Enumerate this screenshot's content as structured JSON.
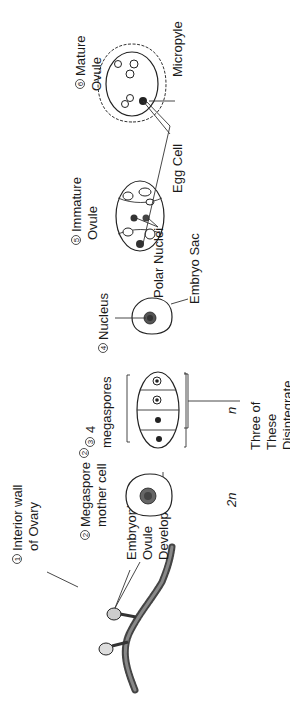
{
  "diagram": {
    "orientation": "rotated-90-ccw",
    "stages": [
      {
        "number": "1",
        "label_line1": "Interior wall",
        "label_line2": "of Ovary"
      },
      {
        "number": "2",
        "label_line1": "Megaspore",
        "label_line2": "mother cell",
        "ploidy": "2n"
      },
      {
        "number": "3",
        "label_line1": "4",
        "label_line2": "megaspores",
        "ploidy": "n"
      },
      {
        "number": "4",
        "label_line1": "Nucleus",
        "label_line2": ""
      },
      {
        "number": "5",
        "label_line1": "Immature",
        "label_line2": "Ovule"
      },
      {
        "number": "6",
        "label_line1": "Mature",
        "label_line2": "Ovule"
      }
    ],
    "annotations": {
      "embryonic_ovule": [
        "Embryonic",
        "Ovule"
      ],
      "develops_into": "Develops into",
      "three_disintegrate": [
        "Three of",
        "These",
        "Disintegrate"
      ],
      "embryo_sac": "Embryo Sac",
      "polar_nuclei": "Polar Nuclei",
      "egg_cell": "Egg Cell",
      "micropyle": "Micropyle"
    },
    "colors": {
      "ink": "#1a1a1a",
      "background": "#ffffff",
      "texture": "#555555"
    }
  }
}
